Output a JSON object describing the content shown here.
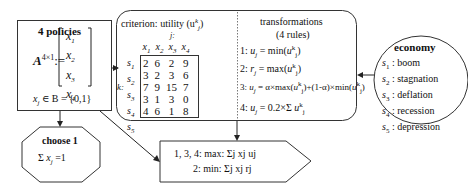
{
  "policies": {
    "title": "4 policies",
    "matrix_lhs": "A",
    "matrix_sup": "4×1",
    "assign": ":=",
    "vector": [
      "x",
      "x",
      "x",
      "x"
    ],
    "vector_sub": [
      "1",
      "2",
      "3",
      "4"
    ],
    "domain_var": "x",
    "domain_sub": "j",
    "domain_text": "∈ B = {0,1}"
  },
  "criterion": {
    "title": "criterion: utility (u",
    "title_sup": "k",
    "title_sub": "j",
    "title_end": ")",
    "col_axis": "j:",
    "row_axis": "k:",
    "columns": [
      "x1",
      "x2",
      "x3",
      "x4"
    ],
    "rows": [
      "s1",
      "s2",
      "s3",
      "s4",
      "s5"
    ],
    "values": [
      [
        2,
        6,
        2,
        9
      ],
      [
        3,
        2,
        3,
        6
      ],
      [
        7,
        9,
        15,
        7
      ],
      [
        3,
        1,
        3,
        0
      ],
      [
        4,
        6,
        1,
        8
      ]
    ]
  },
  "transformations": {
    "title": "transformations",
    "subtitle": "(4 rules)",
    "rules": [
      "1: uj = min_k(u_j^k)",
      "2: rj = max_k(u_j^k)",
      "3: uj = α×max_k(u_j^k)+(1-α)×min_k(u_j^k)",
      "4: uj = 0.2×Σ_{k=1}^{5} u_j^k"
    ]
  },
  "economy": {
    "title": "economy",
    "states": [
      {
        "id": "s1",
        "label": ": boom"
      },
      {
        "id": "s2",
        "label": ": stagnation"
      },
      {
        "id": "s3",
        "label": ": deflation"
      },
      {
        "id": "s4",
        "label": ": recession"
      },
      {
        "id": "s5",
        "label": ": depression"
      }
    ]
  },
  "choose": {
    "title": "choose 1",
    "constraint": "Σ_{j=1}^{4} x_j = 1"
  },
  "objective": {
    "line1": "1, 3, 4: max: Σj xj uj",
    "line2": "2: min: Σj xj rj"
  }
}
